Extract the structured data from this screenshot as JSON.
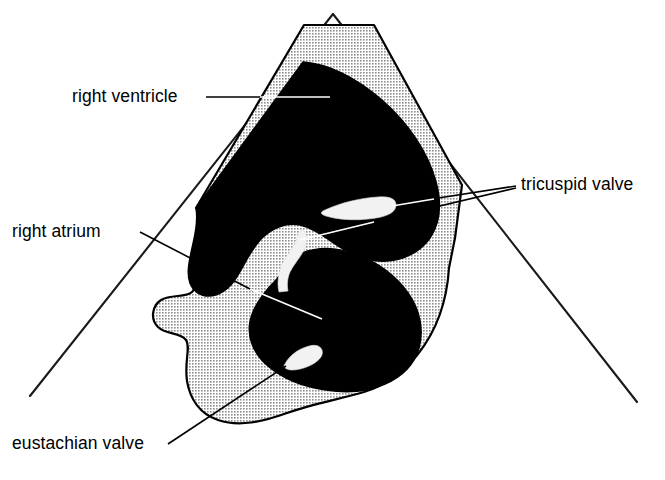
{
  "figure": {
    "modality": "two-dimensional echocardiogram sector scan",
    "background_color": "#ffffff",
    "cavity_color": "#000000",
    "tissue_color": "#c9c9c9",
    "valve_color": "#f2f2f2",
    "outline_color": "#000000"
  },
  "labels": [
    {
      "id": "right-ventricle",
      "text": "right ventricle",
      "x": 72,
      "y": 102,
      "anchor": "start",
      "leader_style": "on-white-then-black"
    },
    {
      "id": "right-atrium",
      "text": "right atrium",
      "x": 12,
      "y": 237,
      "anchor": "start",
      "leader_style": "on-white-then-black"
    },
    {
      "id": "tricuspid-valve",
      "text": "tricuspid valve",
      "x": 521,
      "y": 190,
      "anchor": "start",
      "leader_style": "forked"
    },
    {
      "id": "eustachian-valve",
      "text": "eustachian valve",
      "x": 12,
      "y": 449,
      "anchor": "start",
      "leader_style": "on-white"
    }
  ],
  "structures": [
    {
      "id": "right-ventricle-cavity",
      "kind": "cavity",
      "fill": "#000000"
    },
    {
      "id": "right-atrium-cavity",
      "kind": "cavity",
      "fill": "#000000"
    },
    {
      "id": "myocardium-tissue",
      "kind": "tissue",
      "fill": "#c9c9c9"
    },
    {
      "id": "tricuspid-anterior-leaflet",
      "kind": "valve-leaflet",
      "fill": "#f2f2f2"
    },
    {
      "id": "tricuspid-septal-leaflet",
      "kind": "valve-leaflet",
      "fill": "#f2f2f2"
    },
    {
      "id": "eustachian-valve-leaflet",
      "kind": "valve-leaflet",
      "fill": "#f2f2f2"
    }
  ],
  "sector": {
    "apex_left": {
      "x": 30,
      "y": 396
    },
    "apex_right": {
      "x": 637,
      "y": 402
    },
    "vertex": {
      "x": 333,
      "y": 14
    },
    "description": "ultrasound sector scan boundary lines"
  }
}
